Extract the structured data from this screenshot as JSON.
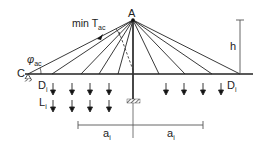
{
  "diagram": {
    "type": "cable-stayed structure schematic",
    "labels": {
      "apex": "A",
      "anchor": "C",
      "min_tension": "min T",
      "min_tension_sub": "ac",
      "angle": "φ",
      "angle_sub": "ac",
      "height": "h",
      "dead_load_left": "D",
      "dead_load_left_sub": "i",
      "dead_load_right": "D",
      "dead_load_right_sub": "i",
      "live_load": "L",
      "live_load_sub": "i",
      "spacing_left": "a",
      "spacing_left_sub": "i",
      "spacing_right": "a",
      "spacing_right_sub": "i"
    },
    "geometry": {
      "apex": [
        133,
        20
      ],
      "deck_y": 74,
      "deck_x": [
        25,
        253
      ],
      "left_cable_anchors_x": [
        28,
        52,
        81,
        99,
        118
      ],
      "right_cable_anchors_x": [
        159,
        185,
        212,
        240
      ],
      "dead_load_arrows_x": [
        53,
        72,
        90,
        109,
        166,
        184,
        203,
        221
      ],
      "live_load_arrows_x": [
        53,
        72,
        90,
        109
      ]
    },
    "colors": {
      "line": "#222222",
      "dimension": "#555555"
    }
  }
}
